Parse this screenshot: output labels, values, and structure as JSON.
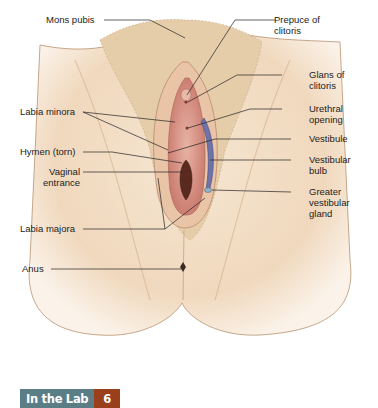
{
  "diagram": {
    "labels_left": [
      {
        "id": "mons-pubis",
        "text": "Mons pubis"
      },
      {
        "id": "labia-minora",
        "text": "Labia minora"
      },
      {
        "id": "hymen",
        "text": "Hymen (torn)"
      },
      {
        "id": "vaginal-entrance",
        "text": "Vaginal\nentrance"
      },
      {
        "id": "labia-majora",
        "text": "Labia majora"
      },
      {
        "id": "anus",
        "text": "Anus"
      }
    ],
    "labels_right": [
      {
        "id": "prepuce",
        "text": "Prepuce of\nclitoris"
      },
      {
        "id": "glans",
        "text": "Glans of\nclitoris"
      },
      {
        "id": "urethral-opening",
        "text": "Urethral\nopening"
      },
      {
        "id": "vestibule",
        "text": "Vestibule"
      },
      {
        "id": "vestibular-bulb",
        "text": "Vestibular\nbulb"
      },
      {
        "id": "greater-vestibular-gland",
        "text": "Greater\nvestibular\ngland"
      }
    ]
  },
  "footer": {
    "section_label": "In the Lab",
    "section_number": "6"
  },
  "colors": {
    "skin": "#f0d9bf",
    "skin_shadow": "#d9b48f",
    "mucosa": "#d9958a",
    "bulb": "#6f74a8",
    "badge_label_bg": "#5a7d86",
    "badge_number_bg": "#9a3f1c"
  }
}
